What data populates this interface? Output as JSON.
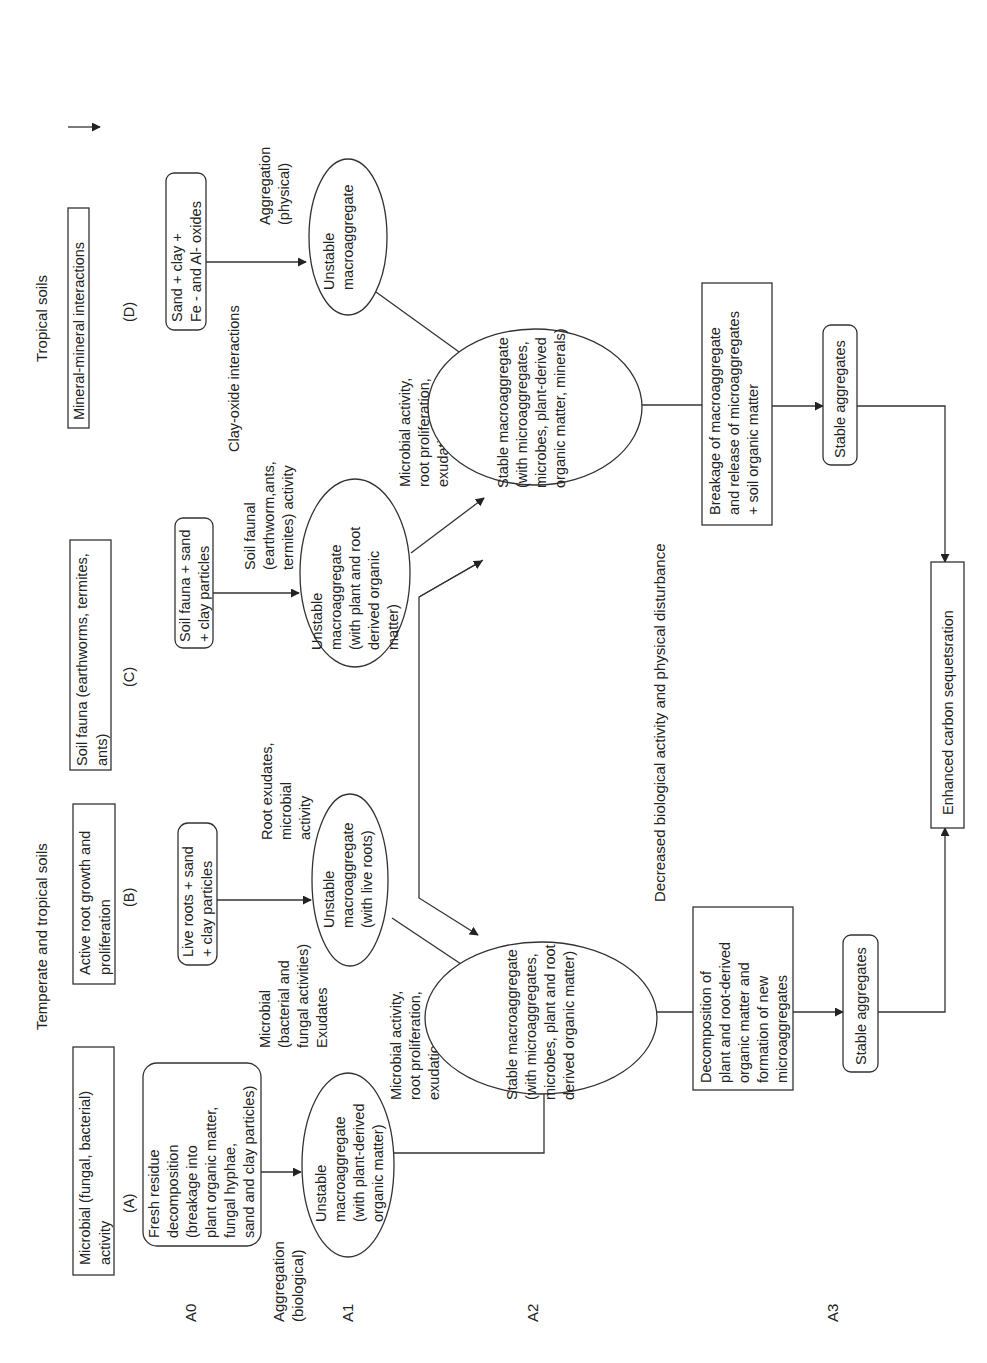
{
  "diagram": {
    "orientation": "rotated-90-ccw",
    "headers": {
      "temperate": "Temperate and tropical soils",
      "tropical": "Tropical soils"
    },
    "legend": {
      "arrow": "arrow-icon"
    },
    "columns": {
      "A": {
        "letter": "(A)",
        "title": [
          "Microbial (fungal, bacterial)",
          "activity"
        ],
        "source": [
          "Fresh residue",
          "decomposition",
          "(breakage into",
          "plant organic matter,",
          "fungal hyphae,",
          "sand and clay particles)"
        ],
        "unstable": [
          "Unstable",
          "macroaggregate",
          "(with plant-derived",
          "organic matter)"
        ],
        "process": [
          "Microbial activity,",
          "root proliferation,",
          "exudation"
        ]
      },
      "B": {
        "letter": "(B)",
        "title": [
          "Active root growth and",
          "proliferation"
        ],
        "source": [
          "Live roots + sand",
          "+ clay particles"
        ],
        "agent_left": [
          "Microbial",
          "(bacterial and",
          "fungal activities)",
          "Exudates"
        ],
        "agent_right": [
          "Root exudates,",
          "microbial",
          "activity"
        ],
        "unstable": [
          "Unstable",
          "macroaggregate",
          "(with live roots)"
        ]
      },
      "C": {
        "letter": "(C)",
        "title": [
          "Soil fauna (earthworms, termites,",
          "ants)"
        ],
        "source": [
          "Soil fauna + sand",
          "+ clay particles"
        ],
        "agent": [
          "Soil faunal",
          "(earthworm,ants,",
          "termites) activity"
        ],
        "unstable": [
          "Unstable",
          "macroaggregate",
          "(with plant and root",
          "derived organic",
          "matter)"
        ],
        "process": [
          "Microbial activity,",
          "root proliferation,",
          "exudation"
        ]
      },
      "D": {
        "letter": "(D)",
        "title": [
          "Mineral-mineral interactions"
        ],
        "source": [
          "Sand + clay +",
          "Fe - and Al- oxides"
        ],
        "agent": [
          "Aggregation",
          "(physical)"
        ],
        "interaction": [
          "Clay-oxide interactions"
        ],
        "unstable": [
          "Unstable",
          "macroaggregate"
        ]
      }
    },
    "stages": {
      "A0": "A0",
      "A1": "A1",
      "A2": "A2",
      "A3": "A3",
      "aggregation_bio": [
        "Aggregation",
        "(biological)"
      ]
    },
    "stable_ab": [
      "Stable macroaggregate",
      "(with microaggregates,",
      "microbes, plant and root",
      "derived organic matter)"
    ],
    "stable_cd": [
      "Stable macroaggregate",
      "(with microaggregates,",
      "microbes, plant-derived",
      "organic matter, minerals)"
    ],
    "disturbance": "Decreased biological activity and physical disturbance",
    "decomposition": [
      "Decomposition of",
      "plant and root-derived",
      "organic matter and",
      "formation of new",
      "microaggregates"
    ],
    "breakage": [
      "Breakage of macroaggregate",
      "and release of microaggregates",
      "+ soil organic matter"
    ],
    "stable_aggregates_left": "Stable aggregates",
    "stable_aggregates_right": "Stable aggregates",
    "outcome": "Enhanced carbon sequetsration"
  }
}
